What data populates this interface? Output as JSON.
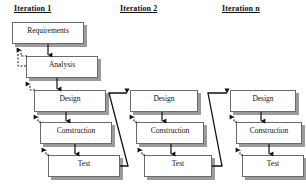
{
  "diagram": {
    "title_style": "underlined-bold",
    "columns": [
      {
        "id": "iteration-1",
        "title": "Iteration 1",
        "title_x": 14,
        "title_y": 4,
        "phases": [
          {
            "label": "Requirements",
            "x": 12,
            "y": 22,
            "w": 72,
            "h": 22
          },
          {
            "label": "Analysis",
            "x": 26,
            "y": 56,
            "w": 72,
            "h": 22
          },
          {
            "label": "Design",
            "x": 34,
            "y": 90,
            "w": 72,
            "h": 22
          },
          {
            "label": "Construction",
            "x": 40,
            "y": 122,
            "w": 72,
            "h": 22
          },
          {
            "label": "Test",
            "x": 48,
            "y": 155,
            "w": 72,
            "h": 22
          }
        ]
      },
      {
        "id": "iteration-2",
        "title": "Iteration 2",
        "title_x": 120,
        "title_y": 4,
        "phases": [
          {
            "label": "Design",
            "x": 130,
            "y": 90,
            "w": 68,
            "h": 22
          },
          {
            "label": "Construction",
            "x": 136,
            "y": 122,
            "w": 68,
            "h": 22
          },
          {
            "label": "Test",
            "x": 144,
            "y": 155,
            "w": 68,
            "h": 22
          }
        ]
      },
      {
        "id": "iteration-n",
        "title": "Iteration n",
        "title_x": 222,
        "title_y": 4,
        "phases": [
          {
            "label": "Design",
            "x": 230,
            "y": 90,
            "w": 66,
            "h": 22
          },
          {
            "label": "Construction",
            "x": 236,
            "y": 122,
            "w": 66,
            "h": 22
          },
          {
            "label": "Test",
            "x": 242,
            "y": 155,
            "w": 62,
            "h": 22
          }
        ]
      }
    ],
    "colors": {
      "box_border": "#6b6b6b",
      "box_fill": "#ffffff",
      "shadow": "#9b9b9b",
      "flow_arrow": "#111111",
      "feedback_arrow": "#111111",
      "text": "#111111",
      "background": "#ffffff"
    },
    "connectors": {
      "forward_flow": "solid-down-arrow",
      "feedback_flow": "dashed-up-arrow",
      "iteration_link": "solid-diagonal-arrow"
    }
  }
}
